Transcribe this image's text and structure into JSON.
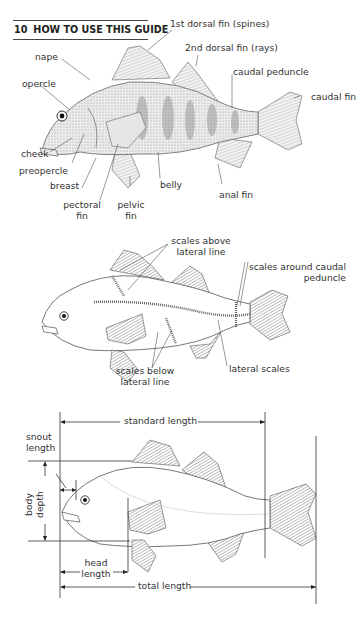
{
  "header": {
    "page_number": "10",
    "section_title": "HOW TO USE THIS GUIDE"
  },
  "figure1": {
    "title": "External anatomy of a perch",
    "labels": {
      "dorsal1": "1st dorsal fin (spines)",
      "dorsal2": "2nd dorsal fin (rays)",
      "nape": "nape",
      "opercle": "opercle",
      "caudal_peduncle": "caudal peduncle",
      "caudal_fin": "caudal fin",
      "cheek": "cheek",
      "preopercle": "preopercle",
      "breast": "breast",
      "pectoral_1": "pectoral",
      "pectoral_2": "fin",
      "pelvic_1": "pelvic",
      "pelvic_2": "fin",
      "belly": "belly",
      "anal_fin": "anal fin"
    }
  },
  "figure2": {
    "title": "Scale counts",
    "labels": {
      "above_1": "scales above",
      "above_2": "lateral line",
      "around_1": "scales around caudal",
      "around_2": "peduncle",
      "below_1": "scales below",
      "below_2": "lateral line",
      "lateral": "lateral scales"
    }
  },
  "figure3": {
    "title": "Body measurements",
    "labels": {
      "standard_length": "standard length",
      "snout_1": "snout",
      "snout_2": "length",
      "body_1": "body",
      "body_2": "depth",
      "head_1": "head",
      "head_2": "length",
      "total_length": "total length"
    }
  },
  "colors": {
    "ink": "#222222",
    "line": "#444444",
    "fish_shade": "#b8b8b8",
    "background": "#ffffff"
  }
}
